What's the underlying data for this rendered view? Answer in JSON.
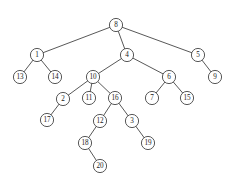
{
  "figure": {
    "background_color": "#ffffff",
    "stroke_color": "#3a3a3a",
    "node_fill_color": "#ffffff",
    "label_color": "#1a1a1a",
    "node_radius": 6.6,
    "width": 232,
    "height": 187
  },
  "chart_data": {
    "type": "diagram",
    "diagram_kind": "tree",
    "root": "8",
    "node_count": 20,
    "edge_count": 19,
    "nodes": [
      {
        "id": "8",
        "label": "8",
        "x": 116,
        "y": 25,
        "depth": 0
      },
      {
        "id": "1",
        "label": "1",
        "x": 37,
        "y": 55,
        "depth": 1
      },
      {
        "id": "4",
        "label": "4",
        "x": 127,
        "y": 55,
        "depth": 1
      },
      {
        "id": "5",
        "label": "5",
        "x": 198,
        "y": 55,
        "depth": 1
      },
      {
        "id": "13",
        "label": "13",
        "x": 20,
        "y": 77,
        "depth": 2
      },
      {
        "id": "14",
        "label": "14",
        "x": 55,
        "y": 77,
        "depth": 2
      },
      {
        "id": "10",
        "label": "10",
        "x": 93,
        "y": 77,
        "depth": 2
      },
      {
        "id": "6",
        "label": "6",
        "x": 169,
        "y": 77,
        "depth": 2
      },
      {
        "id": "9",
        "label": "9",
        "x": 215,
        "y": 77,
        "depth": 2
      },
      {
        "id": "2",
        "label": "2",
        "x": 63,
        "y": 99,
        "depth": 3
      },
      {
        "id": "11",
        "label": "11",
        "x": 89,
        "y": 98,
        "depth": 3
      },
      {
        "id": "16",
        "label": "16",
        "x": 115,
        "y": 98,
        "depth": 3
      },
      {
        "id": "7",
        "label": "7",
        "x": 152,
        "y": 98,
        "depth": 3
      },
      {
        "id": "15",
        "label": "15",
        "x": 187,
        "y": 98,
        "depth": 3
      },
      {
        "id": "17",
        "label": "17",
        "x": 47,
        "y": 120,
        "depth": 4
      },
      {
        "id": "12",
        "label": "12",
        "x": 100,
        "y": 121,
        "depth": 4
      },
      {
        "id": "3",
        "label": "3",
        "x": 132,
        "y": 121,
        "depth": 4
      },
      {
        "id": "18",
        "label": "18",
        "x": 85,
        "y": 143,
        "depth": 5
      },
      {
        "id": "19",
        "label": "19",
        "x": 148,
        "y": 143,
        "depth": 5
      },
      {
        "id": "20",
        "label": "20",
        "x": 100,
        "y": 166,
        "depth": 6
      }
    ],
    "edges": [
      {
        "from": "8",
        "to": "1"
      },
      {
        "from": "8",
        "to": "4"
      },
      {
        "from": "8",
        "to": "5"
      },
      {
        "from": "1",
        "to": "13"
      },
      {
        "from": "1",
        "to": "14"
      },
      {
        "from": "4",
        "to": "10"
      },
      {
        "from": "4",
        "to": "6"
      },
      {
        "from": "5",
        "to": "9"
      },
      {
        "from": "10",
        "to": "2"
      },
      {
        "from": "10",
        "to": "11"
      },
      {
        "from": "10",
        "to": "16"
      },
      {
        "from": "6",
        "to": "7"
      },
      {
        "from": "6",
        "to": "15"
      },
      {
        "from": "2",
        "to": "17"
      },
      {
        "from": "16",
        "to": "12"
      },
      {
        "from": "16",
        "to": "3"
      },
      {
        "from": "12",
        "to": "18"
      },
      {
        "from": "3",
        "to": "19"
      },
      {
        "from": "18",
        "to": "20"
      }
    ]
  }
}
